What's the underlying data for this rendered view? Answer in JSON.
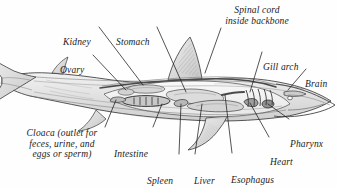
{
  "figure": {
    "style": "pen-and-ink grayscale scientific illustration",
    "background_color": "#fefefe",
    "ink_color": "#1b1b1b",
    "width": 337,
    "height": 187
  },
  "labels": [
    {
      "id": "kidney",
      "text": "Kidney",
      "lines": [
        "Kidney"
      ],
      "x": 63,
      "y": 16,
      "align": "left",
      "leader": {
        "x1": 99,
        "y1": 27,
        "x2": 143,
        "y2": 85
      }
    },
    {
      "id": "stomach",
      "text": "Stomach",
      "lines": [
        "Stomach"
      ],
      "x": 116,
      "y": 16,
      "align": "left",
      "leader": {
        "x1": 157,
        "y1": 27,
        "x2": 186,
        "y2": 92
      }
    },
    {
      "id": "spinal-cord",
      "text": "Spinal cord inside backbone",
      "lines": [
        "Spinal cord",
        "inside backbone"
      ],
      "x": 217,
      "y": 5,
      "align": "center",
      "leader": {
        "x1": 221,
        "y1": 28,
        "x2": 205,
        "y2": 73
      }
    },
    {
      "id": "gill-arch",
      "text": "Gill arch",
      "lines": [
        "Gill arch"
      ],
      "x": 263,
      "y": 41,
      "align": "left",
      "leader": {
        "x1": 262,
        "y1": 52,
        "x2": 250,
        "y2": 92
      }
    },
    {
      "id": "brain",
      "text": "Brain",
      "lines": [
        "Brain"
      ],
      "x": 305,
      "y": 58,
      "align": "left",
      "leader": {
        "x1": 306,
        "y1": 69,
        "x2": 288,
        "y2": 90
      }
    },
    {
      "id": "pharynx",
      "text": "Pharynx",
      "lines": [
        "Pharynx"
      ],
      "x": 290,
      "y": 118,
      "align": "left",
      "leader": {
        "x1": 289,
        "y1": 119,
        "x2": 268,
        "y2": 104
      }
    },
    {
      "id": "heart",
      "text": "Heart",
      "lines": [
        "Heart"
      ],
      "x": 270,
      "y": 136,
      "align": "left",
      "leader": {
        "x1": 269,
        "y1": 137,
        "x2": 250,
        "y2": 103
      }
    },
    {
      "id": "esophagus",
      "text": "Esophagus",
      "lines": [
        "Esophagus"
      ],
      "x": 231,
      "y": 154,
      "align": "left",
      "leader": {
        "x1": 232,
        "y1": 153,
        "x2": 225,
        "y2": 95
      }
    },
    {
      "id": "liver",
      "text": "Liver",
      "lines": [
        "Liver"
      ],
      "x": 194,
      "y": 155,
      "align": "left",
      "leader": {
        "x1": 195,
        "y1": 154,
        "x2": 202,
        "y2": 104
      }
    },
    {
      "id": "spleen",
      "text": "Spleen",
      "lines": [
        "Spleen"
      ],
      "x": 147,
      "y": 155,
      "align": "left",
      "leader": {
        "x1": 179,
        "y1": 154,
        "x2": 181,
        "y2": 104
      }
    },
    {
      "id": "intestine",
      "text": "Intestine",
      "lines": [
        "Intestine"
      ],
      "x": 114,
      "y": 128,
      "align": "left",
      "leader": {
        "x1": 153,
        "y1": 127,
        "x2": 162,
        "y2": 104
      }
    },
    {
      "id": "cloaca",
      "text": "Cloaca (outlet for feces, urine, and eggs or sperm)",
      "lines": [
        "Cloaca (outlet for",
        "feces, urine, and",
        "eggs or sperm)"
      ],
      "x": 18,
      "y": 128,
      "align": "center",
      "leader": {
        "x1": 105,
        "y1": 127,
        "x2": 116,
        "y2": 100
      }
    }
  ]
}
